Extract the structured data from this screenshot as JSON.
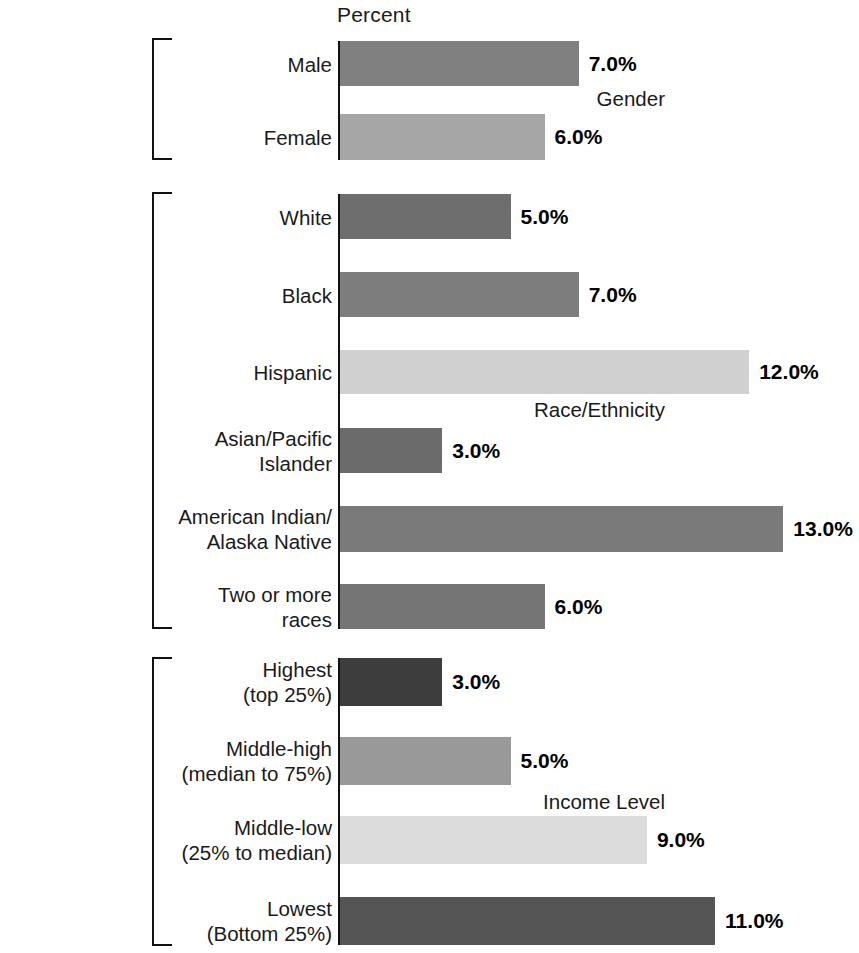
{
  "chart_data": {
    "type": "bar",
    "orientation": "horizontal",
    "title": "",
    "xlabel": "Percent",
    "ylabel": "",
    "xlim": [
      0,
      15
    ],
    "grid": false,
    "legend": null,
    "value_label_format": "0.0%",
    "categories": [
      "Male",
      "Female",
      "White",
      "Black",
      "Hispanic",
      "Asian/Pacific Islander",
      "American Indian/ Alaska Native",
      "Two or more races",
      "Highest (top 25%)",
      "Middle-high (median to 75%)",
      "Middle-low (25% to median)",
      "Lowest (Bottom 25%)"
    ],
    "values": [
      7.0,
      6.0,
      5.0,
      7.0,
      12.0,
      3.0,
      13.0,
      6.0,
      3.0,
      5.0,
      9.0,
      11.0
    ],
    "groups": [
      {
        "name": "Gender",
        "categories": [
          "Male",
          "Female"
        ],
        "values": [
          7.0,
          6.0
        ]
      },
      {
        "name": "Race/Ethnicity",
        "categories": [
          "White",
          "Black",
          "Hispanic",
          "Asian/Pacific Islander",
          "American Indian/ Alaska Native",
          "Two or more races"
        ],
        "values": [
          5.0,
          7.0,
          12.0,
          3.0,
          13.0,
          6.0
        ]
      },
      {
        "name": "Income Level",
        "categories": [
          "Highest (top 25%)",
          "Middle-high (median to 75%)",
          "Middle-low (25% to median)",
          "Lowest (Bottom 25%)"
        ],
        "values": [
          3.0,
          5.0,
          9.0,
          11.0
        ]
      }
    ]
  },
  "axis": {
    "percent_label": "Percent"
  },
  "groups": [
    {
      "label": "Gender",
      "bracket_top": 38,
      "bracket_height": 122,
      "label_y": 99,
      "bars": [
        {
          "label": "Male",
          "label_lines": [
            "Male"
          ],
          "value": 7.0,
          "value_label": "7.0%",
          "color": "#808080",
          "top": 41,
          "height": 45
        },
        {
          "label": "Female",
          "label_lines": [
            "Female"
          ],
          "value": 6.0,
          "value_label": "6.0%",
          "color": "#a6a6a6",
          "top": 114,
          "height": 46
        }
      ]
    },
    {
      "label": "Race/Ethnicity",
      "bracket_top": 192,
      "bracket_height": 437,
      "label_y": 410,
      "bars": [
        {
          "label": "White",
          "label_lines": [
            "White"
          ],
          "value": 5.0,
          "value_label": "5.0%",
          "color": "#6e6e6e",
          "top": 194,
          "height": 45
        },
        {
          "label": "Black",
          "label_lines": [
            "Black"
          ],
          "value": 7.0,
          "value_label": "7.0%",
          "color": "#7d7d7d",
          "top": 272,
          "height": 45
        },
        {
          "label": "Hispanic",
          "label_lines": [
            "Hispanic"
          ],
          "value": 12.0,
          "value_label": "12.0%",
          "color": "#d0d0d0",
          "top": 350,
          "height": 44
        },
        {
          "label": "Asian/Pacific Islander",
          "label_lines": [
            "Asian/Pacific",
            "Islander"
          ],
          "value": 3.0,
          "value_label": "3.0%",
          "color": "#6b6b6b",
          "top": 428,
          "height": 45
        },
        {
          "label": "American Indian/ Alaska Native",
          "label_lines": [
            "American Indian/",
            "Alaska Native"
          ],
          "value": 13.0,
          "value_label": "13.0%",
          "color": "#7a7a7a",
          "top": 506,
          "height": 46
        },
        {
          "label": "Two or more races",
          "label_lines": [
            "Two or more",
            "races"
          ],
          "value": 6.0,
          "value_label": "6.0%",
          "color": "#757575",
          "top": 584,
          "height": 45
        }
      ]
    },
    {
      "label": "Income Level",
      "bracket_top": 657,
      "bracket_height": 289,
      "label_y": 802,
      "bars": [
        {
          "label": "Highest (top 25%)",
          "label_lines": [
            "Highest",
            "(top 25%)"
          ],
          "value": 3.0,
          "value_label": "3.0%",
          "color": "#3d3d3d",
          "top": 658,
          "height": 48
        },
        {
          "label": "Middle-high (median to 75%)",
          "label_lines": [
            "Middle-high",
            "(median to 75%)"
          ],
          "value": 5.0,
          "value_label": "5.0%",
          "color": "#999999",
          "top": 737,
          "height": 48
        },
        {
          "label": "Middle-low (25% to median)",
          "label_lines": [
            "Middle-low",
            "(25% to median)"
          ],
          "value": 9.0,
          "value_label": "9.0%",
          "color": "#dcdcdc",
          "top": 816,
          "height": 48
        },
        {
          "label": "Lowest (Bottom 25%)",
          "label_lines": [
            "Lowest",
            "(Bottom 25%)"
          ],
          "value": 11.0,
          "value_label": "11.0%",
          "color": "#555555",
          "top": 897,
          "height": 48
        }
      ]
    }
  ],
  "scale": {
    "origin_x": 340,
    "px_per_percent": 34.1,
    "value_gap": 10
  }
}
